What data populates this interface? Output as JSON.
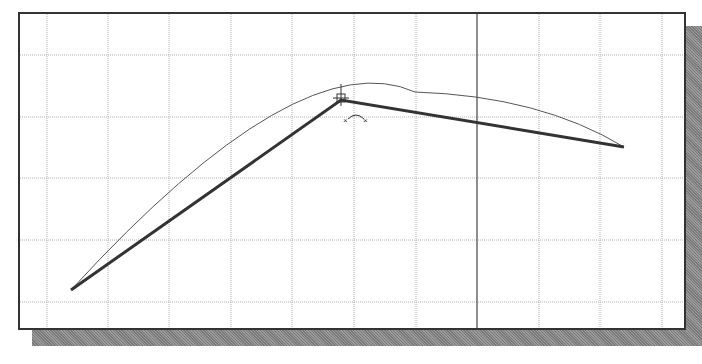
{
  "viewport": {
    "type": "cad-drawing-area",
    "grid": {
      "vertical_lines_x": [
        47,
        108,
        169,
        231,
        292,
        354,
        416,
        539,
        600,
        662
      ],
      "horizontal_lines_y": [
        55,
        117,
        178,
        240,
        302
      ],
      "color": "#b0b0b0"
    },
    "axis_line_x": 477,
    "colors": {
      "frame": "#333333",
      "polyline": "#333333",
      "arc": "#555555",
      "background": "#ffffff"
    }
  },
  "drawing": {
    "polyline_points": [
      [
        71,
        290
      ],
      [
        341,
        100
      ],
      [
        624,
        147
      ]
    ],
    "arc": {
      "start": [
        71,
        290
      ],
      "control": [
        300,
        40
      ],
      "mid": [
        415,
        92
      ],
      "end": [
        624,
        147
      ]
    },
    "cursor": {
      "x": 341,
      "y": 100
    },
    "constraint_marker": {
      "x": 356,
      "y": 118
    }
  }
}
